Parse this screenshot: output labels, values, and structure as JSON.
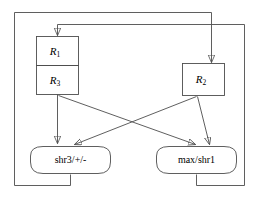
{
  "diagram": {
    "type": "dataflow-block-diagram",
    "stroke_color": "#4d4d4d",
    "text_color": "#000000",
    "background_color": "#ffffff",
    "nodes": {
      "r1": {
        "label": "R",
        "subscript": "1",
        "shape": "rectangle"
      },
      "r3": {
        "label": "R",
        "subscript": "3",
        "shape": "rectangle"
      },
      "r2": {
        "label": "R",
        "subscript": "2",
        "shape": "rectangle"
      },
      "shr3": {
        "label": "shr3/+/-",
        "shape": "stadium"
      },
      "max_shr1": {
        "label": "max/shr1",
        "shape": "stadium"
      }
    },
    "edges": [
      {
        "from": "r3",
        "to": "shr3",
        "style": "straight-arrow"
      },
      {
        "from": "r3",
        "to": "max_shr1",
        "style": "diagonal-arrow"
      },
      {
        "from": "r2",
        "to": "shr3",
        "style": "diagonal-arrow"
      },
      {
        "from": "r2",
        "to": "max_shr1",
        "style": "diagonal-arrow"
      },
      {
        "from": "shr3",
        "to": "r1",
        "style": "feedback-loop-outer"
      },
      {
        "from": "max_shr1",
        "to": "r2",
        "style": "feedback-loop-inner"
      }
    ]
  }
}
